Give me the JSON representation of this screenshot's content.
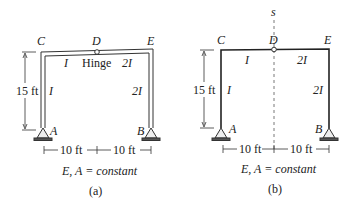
{
  "figures": [
    {
      "id": "a",
      "caption": "(a)",
      "nodes": {
        "C": "C",
        "D": "D",
        "E": "E",
        "A": "A",
        "B": "B"
      },
      "hinge_label": "Hinge",
      "member_labels": {
        "CD": "I",
        "DE": "2I",
        "AC": "I",
        "BE": "2I"
      },
      "height_dim": "15 ft",
      "span_dims": [
        "10 ft",
        "10 ft"
      ],
      "note": "E, A = constant"
    },
    {
      "id": "b",
      "caption": "(b)",
      "nodes": {
        "C": "C",
        "D": "D",
        "E": "E",
        "A": "A",
        "B": "B"
      },
      "axis_label": "s",
      "member_labels": {
        "CD": "I",
        "DE": "2I",
        "AC": "I",
        "BE": "2I"
      },
      "height_dim": "15 ft",
      "span_dims": [
        "10 ft",
        "10 ft"
      ],
      "note": "E, A = constant"
    }
  ],
  "colors": {
    "line": "#222222",
    "frame_fill": "#e8e8e8"
  }
}
